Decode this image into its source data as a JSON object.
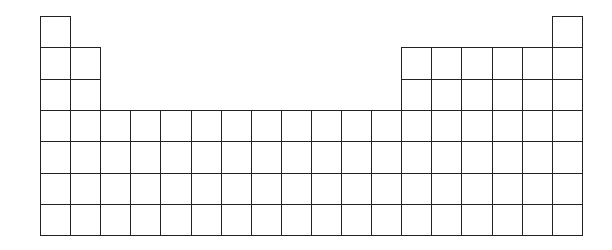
{
  "diagram": {
    "type": "blank-periodic-table",
    "columns": 18,
    "rows": 7,
    "origin": {
      "x": 40,
      "y": 16
    },
    "cell_width": 30.1,
    "cell_height": 31.3,
    "line_color": "#222222",
    "background": "#ffffff",
    "row_layout": [
      {
        "row": 1,
        "columns": [
          1,
          18
        ]
      },
      {
        "row": 2,
        "columns": [
          1,
          2,
          13,
          14,
          15,
          16,
          17,
          18
        ]
      },
      {
        "row": 3,
        "columns": [
          1,
          2,
          13,
          14,
          15,
          16,
          17,
          18
        ]
      },
      {
        "row": 4,
        "columns": [
          1,
          2,
          3,
          4,
          5,
          6,
          7,
          8,
          9,
          10,
          11,
          12,
          13,
          14,
          15,
          16,
          17,
          18
        ]
      },
      {
        "row": 5,
        "columns": [
          1,
          2,
          3,
          4,
          5,
          6,
          7,
          8,
          9,
          10,
          11,
          12,
          13,
          14,
          15,
          16,
          17,
          18
        ]
      },
      {
        "row": 6,
        "columns": [
          1,
          2,
          3,
          4,
          5,
          6,
          7,
          8,
          9,
          10,
          11,
          12,
          13,
          14,
          15,
          16,
          17,
          18
        ]
      },
      {
        "row": 7,
        "columns": [
          1,
          2,
          3,
          4,
          5,
          6,
          7,
          8,
          9,
          10,
          11,
          12,
          13,
          14,
          15,
          16,
          17,
          18
        ]
      }
    ]
  }
}
